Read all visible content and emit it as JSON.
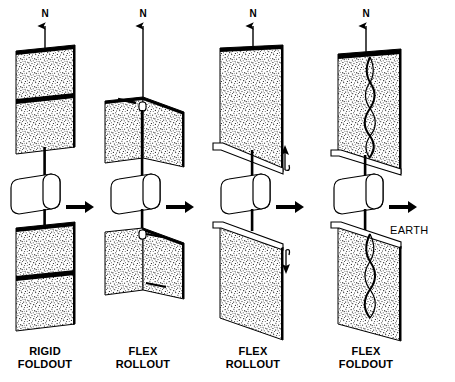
{
  "figure": {
    "background_color": "#ffffff",
    "ink_color": "#000000",
    "panel_fill": "#d9d9d9",
    "edge_color": "#000000"
  },
  "annotations": {
    "north_label": "N",
    "earth_label": "EARTH"
  },
  "columns": [
    {
      "id": "rigid-foldout",
      "label_line1": "RIGID",
      "label_line2": "FOLDOUT",
      "panel_style": "foldout-rigid",
      "north_label": "N",
      "center_x": 130,
      "upper_panel": {
        "fold_lines": 1,
        "split": "horizontal"
      },
      "lower_panel": {
        "fold_lines": 1,
        "split": "horizontal"
      }
    },
    {
      "id": "flex-rollout-1",
      "label_line1": "FLEX",
      "label_line2": "ROLLOUT",
      "panel_style": "rollout-split",
      "north_label": "N",
      "center_x": 143,
      "upper_panel": {
        "roller": "top-center",
        "split": "vertical"
      },
      "lower_panel": {
        "roller": "top-center",
        "split": "vertical"
      }
    },
    {
      "id": "flex-rollout-2",
      "label_line1": "FLEX",
      "label_line2": "ROLLOUT",
      "panel_style": "rollout-bar",
      "north_label": "N",
      "center_x": 253,
      "upper_panel": {
        "roller": "bottom-bar",
        "deploy_arrow": "up"
      },
      "lower_panel": {
        "roller": "top-bar",
        "deploy_arrow": "down"
      }
    },
    {
      "id": "flex-foldout",
      "label_line1": "FLEX",
      "label_line2": "FOLDOUT",
      "panel_style": "foldout-flex",
      "north_label": "N",
      "center_x": 366,
      "upper_panel": {
        "accordion": "vertical-center",
        "bar": "bottom"
      },
      "lower_panel": {
        "accordion": "vertical-center",
        "bar": "top"
      }
    }
  ],
  "spacecraft": {
    "body_shape": "cylinder",
    "count": 4,
    "earth_arrow_direction": "right"
  }
}
